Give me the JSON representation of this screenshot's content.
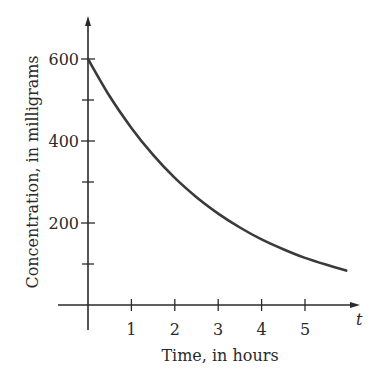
{
  "chart_data": {
    "type": "line",
    "title": "",
    "xlabel": "Time, in hours",
    "ylabel": "Concentration, in milligrams",
    "x_axis_variable": "t",
    "x_ticks": [
      1,
      2,
      3,
      4,
      5
    ],
    "x_tick_labels": [
      "1",
      "2",
      "3",
      "4",
      "5"
    ],
    "y_ticks_major": [
      200,
      400,
      600
    ],
    "y_tick_labels": [
      "200",
      "400",
      "600"
    ],
    "y_ticks_minor": [
      100,
      300,
      500
    ],
    "xlim": [
      0,
      6.2
    ],
    "ylim": [
      0,
      680
    ],
    "grid": false,
    "legend": null,
    "series": [
      {
        "name": "Concentration",
        "description": "Exponential decay starting at 600 mg",
        "x": [
          0,
          0.5,
          1,
          1.5,
          2,
          2.5,
          3,
          3.5,
          4,
          4.5,
          5,
          5.5,
          5.95
        ],
        "values": [
          600,
          509,
          432,
          366,
          310,
          263,
          223,
          189,
          160,
          136,
          115,
          98,
          84
        ]
      }
    ],
    "color": "#3a3a3a"
  }
}
